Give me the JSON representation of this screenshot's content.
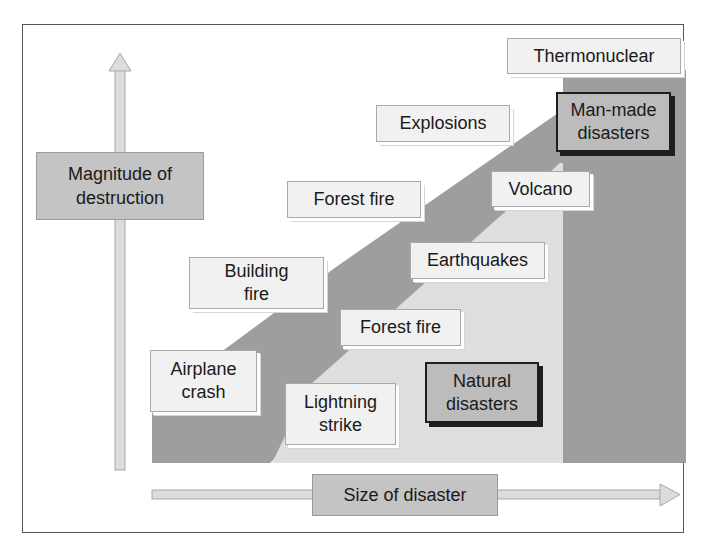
{
  "colors": {
    "frame_border": "#555555",
    "man_made_band": "#9e9e9e",
    "natural_region": "#dedede",
    "label_box": "#f1f1f1",
    "category_box": "#bcbcbc",
    "axis_arrow": "#dcdcdc"
  },
  "axes": {
    "y": {
      "label": "Magnitude of\ndestruction",
      "direction": "up"
    },
    "x": {
      "label": "Size of disaster",
      "direction": "right"
    }
  },
  "categories": {
    "man_made": {
      "label": "Man-made\ndisasters"
    },
    "natural": {
      "label": "Natural\ndisasters"
    }
  },
  "man_made_events": [
    {
      "label": "Airplane\ncrash"
    },
    {
      "label": "Building\nfire"
    },
    {
      "label": "Forest fire"
    },
    {
      "label": "Explosions"
    },
    {
      "label": "Thermonuclear"
    }
  ],
  "natural_events": [
    {
      "label": "Lightning\nstrike"
    },
    {
      "label": "Forest fire"
    },
    {
      "label": "Earthquakes"
    },
    {
      "label": "Volcano"
    }
  ]
}
